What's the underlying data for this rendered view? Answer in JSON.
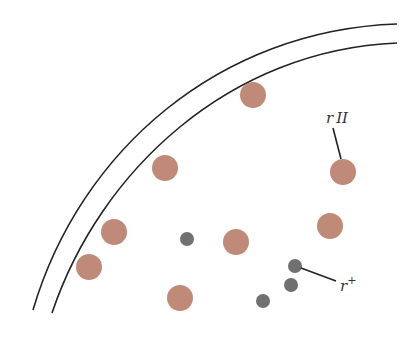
{
  "diagram": {
    "colors": {
      "background": "#ffffff",
      "boundary": "#222222",
      "rII_particle": "#c08a78",
      "r_plus_particle": "#707070",
      "leader_line": "#222222",
      "label": "#333333"
    },
    "boundary_arcs": [
      {
        "name": "outer-wall",
        "path": "M 33 310 C 80 150, 220 30, 397 24"
      },
      {
        "name": "inner-wall",
        "path": "M 52 313 C 100 170, 230 50, 397 43"
      }
    ],
    "rII_particles": [
      {
        "cx": 253,
        "cy": 95,
        "r": 13
      },
      {
        "cx": 165,
        "cy": 168,
        "r": 13
      },
      {
        "cx": 343,
        "cy": 172,
        "r": 13
      },
      {
        "cx": 114,
        "cy": 232,
        "r": 13
      },
      {
        "cx": 330,
        "cy": 226,
        "r": 13
      },
      {
        "cx": 236,
        "cy": 242,
        "r": 13
      },
      {
        "cx": 89,
        "cy": 267,
        "r": 13
      },
      {
        "cx": 180,
        "cy": 298,
        "r": 13
      }
    ],
    "r_plus_particles": [
      {
        "cx": 187,
        "cy": 239,
        "r": 7
      },
      {
        "cx": 295,
        "cy": 266,
        "r": 7
      },
      {
        "cx": 291,
        "cy": 285,
        "r": 7
      },
      {
        "cx": 263,
        "cy": 301,
        "r": 7
      }
    ],
    "labels": {
      "rII": {
        "base": "r",
        "suffix": "II",
        "x": 326,
        "y": 123
      },
      "r_plus": {
        "base": "r",
        "suffix": "+",
        "x": 340,
        "y": 291
      }
    },
    "leaders": {
      "rII": {
        "x1": 333,
        "y1": 128,
        "x2": 341,
        "y2": 159
      },
      "r_plus": {
        "x1": 301,
        "y1": 268,
        "x2": 336,
        "y2": 281
      }
    }
  }
}
